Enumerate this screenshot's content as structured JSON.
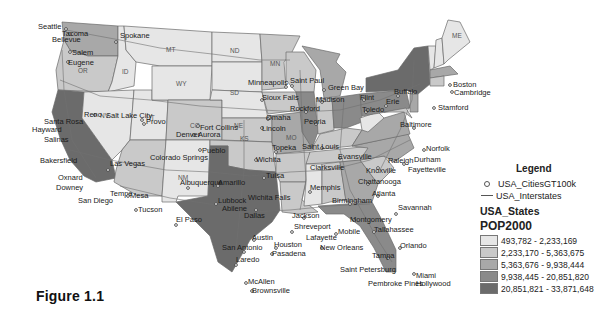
{
  "figure": {
    "caption": "Figure 1.1"
  },
  "legend": {
    "title": "Legend",
    "layers": [
      {
        "name": "USA_CitiesGT100k",
        "symbol": "point-icon"
      },
      {
        "name": "USA_Interstates",
        "symbol": "line-icon"
      }
    ],
    "polygon_layer": "USA_States",
    "field": "POP2000",
    "classes": [
      {
        "range": "493,782 - 2,233,169",
        "color": "#e6e6e6"
      },
      {
        "range": "2,233,170 - 5,363,675",
        "color": "#c9c9c9"
      },
      {
        "range": "5,363,676 - 9,938,444",
        "color": "#a8a8a8"
      },
      {
        "range": "9,938,445 - 20,851,820",
        "color": "#8a8a8a"
      },
      {
        "range": "20,851,821 - 33,871,648",
        "color": "#6b6b6b"
      }
    ]
  },
  "map": {
    "state_labels": [
      "OR",
      "ID",
      "NV",
      "UT",
      "MT",
      "ND",
      "SD",
      "WY",
      "NE",
      "CO",
      "KS",
      "NM",
      "MN",
      "MO",
      "ME"
    ],
    "cities": [
      "Seattle",
      "Tacoma",
      "Bellevue",
      "Spokane",
      "Salem",
      "Eugene",
      "Reno",
      "Salt Lake City",
      "Provo",
      "Santa Rosa",
      "Hayward",
      "Salinas",
      "Bakersfield",
      "Las Vegas",
      "Oxnard",
      "Downey",
      "San Diego",
      "Tempe",
      "Mesa",
      "Tucson",
      "Fort Collins",
      "Denver",
      "Aurora",
      "Pueblo",
      "Colorado Springs",
      "Albuquerque",
      "El Paso",
      "Minneapolis",
      "Saint Paul",
      "Sioux Falls",
      "Omaha",
      "Lincoln",
      "Topeka",
      "Wichita",
      "Amarillo",
      "Lubbock",
      "Wichita Falls",
      "Abilene",
      "Tulsa",
      "Dallas",
      "Austin",
      "San Antonio",
      "Laredo",
      "McAllen",
      "Brownsville",
      "Houston",
      "Pasadena",
      "Shreveport",
      "Jackson",
      "Lafayette",
      "New Orleans",
      "Memphis",
      "Birmingham",
      "Montgomery",
      "Mobile",
      "Green Bay",
      "Madison",
      "Rockford",
      "Flint",
      "Toledo",
      "Peoria",
      "Saint Louis",
      "Evansville",
      "Clarksville",
      "Knoxville",
      "Chattanooga",
      "Atlanta",
      "Savannah",
      "Tallahassee",
      "Orlando",
      "Tampa",
      "Saint Petersburg",
      "Miami",
      "Pembroke Pines",
      "Hollywood",
      "Buffalo",
      "Erie",
      "Baltimore",
      "Norfolk",
      "Raleigh",
      "Durham",
      "Fayetteville",
      "Boston",
      "Cambridge",
      "Stamford"
    ]
  }
}
